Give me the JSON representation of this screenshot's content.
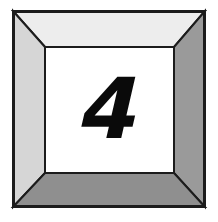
{
  "scene": {
    "title": "Beveled frame with numeral",
    "background_color": "#ffffff",
    "width": 218,
    "height": 222
  },
  "frame": {
    "name": "mitered-picture-frame",
    "outer": {
      "x": 13,
      "y": 11,
      "width": 192,
      "height": 196
    },
    "inner": {
      "x": 45,
      "y": 47,
      "width": 129,
      "height": 126
    },
    "outline_color": "#1c1c1c",
    "outline_width": 2,
    "faces": [
      {
        "name": "top-bevel",
        "side": "top",
        "fill": "#ededed"
      },
      {
        "name": "left-bevel",
        "side": "left",
        "fill": "#d6d6d6"
      },
      {
        "name": "right-bevel",
        "side": "right",
        "fill": "#9a9a9a"
      },
      {
        "name": "bottom-bevel",
        "side": "bottom",
        "fill": "#8f8f8f"
      }
    ]
  },
  "panel": {
    "name": "inner-panel",
    "fill": "#ffffff",
    "numeral": "4",
    "numeral_color": "#0a0a0a"
  }
}
